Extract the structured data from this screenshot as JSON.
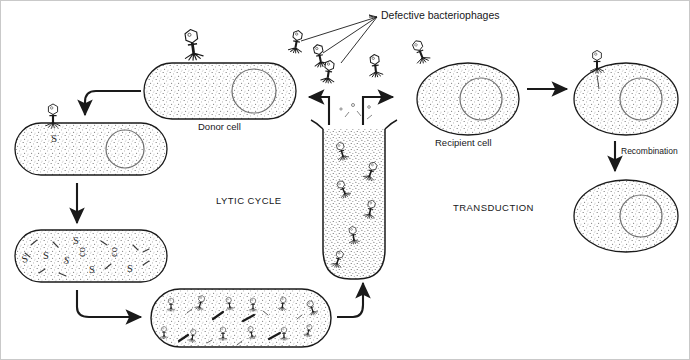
{
  "figure": {
    "title_visible": false,
    "background_color": "#ffffff",
    "ink_color": "#1a1a1a",
    "border_color": "#c9c9c9",
    "labels": {
      "defective_bacteriophages": "Defective bacteriophages",
      "donor_cell": "Donor cell",
      "recipient_cell": "Recipient cell",
      "lytic_cycle": "LYTIC CYCLE",
      "transduction": "TRANSDUCTION",
      "recombination": "Recombination"
    },
    "stages": [
      {
        "name": "donor-cell",
        "shape": "rod",
        "contents": "nucleoid",
        "position": "top-left"
      },
      {
        "name": "infected-cell",
        "shape": "rod",
        "contents": "injected-phage-dna-S",
        "position": "mid-left"
      },
      {
        "name": "replicating-cell",
        "shape": "rod",
        "contents": "phage-dna-fragments-S",
        "position": "lower-left"
      },
      {
        "name": "lysing-cell",
        "shape": "rod",
        "contents": "assembled-phage-particles",
        "position": "bottom-center-left"
      },
      {
        "name": "phage-lysate-tube",
        "shape": "test-tube",
        "contents": "free-phages",
        "position": "center"
      },
      {
        "name": "recipient-cell",
        "shape": "oval",
        "contents": "nucleoid",
        "position": "top-right"
      },
      {
        "name": "infected-recipient-cell",
        "shape": "oval",
        "contents": "nucleoid-with-attached-phage",
        "position": "far-top-right"
      },
      {
        "name": "recombinant-cell",
        "shape": "oval",
        "contents": "nucleoid",
        "position": "far-bottom-right"
      }
    ],
    "arrows": [
      {
        "name": "donor-to-infected",
        "style": "curved",
        "direction": "down-left"
      },
      {
        "name": "infected-to-replicating",
        "style": "straight",
        "direction": "down"
      },
      {
        "name": "replicating-to-lysing",
        "style": "curved",
        "direction": "right"
      },
      {
        "name": "lysing-to-tube",
        "style": "curved",
        "direction": "up"
      },
      {
        "name": "tube-to-lytic-left",
        "style": "elbow",
        "direction": "left"
      },
      {
        "name": "tube-to-transduction-right",
        "style": "elbow",
        "direction": "right"
      },
      {
        "name": "recipient-to-infected-recipient",
        "style": "straight",
        "direction": "right"
      },
      {
        "name": "recombination-arrow",
        "style": "straight",
        "direction": "down"
      }
    ],
    "phage_glyph": {
      "parts": [
        "hexagonal-head",
        "tail-sheath",
        "tail-fibers"
      ],
      "count_free_in_tube": 6,
      "count_above_tube": 4,
      "count_label_pointed": 3
    }
  }
}
